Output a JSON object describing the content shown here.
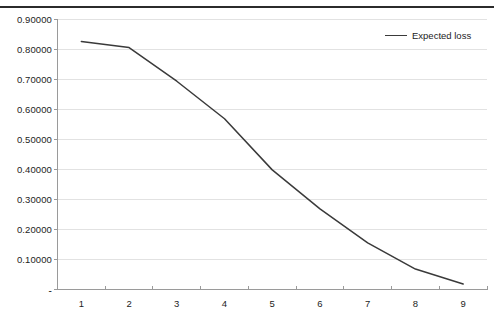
{
  "chart_data": {
    "type": "line",
    "title": "",
    "subtitle": "",
    "xlabel": "",
    "ylabel": "",
    "x": [
      1,
      2,
      3,
      4,
      5,
      6,
      7,
      8,
      9
    ],
    "categories": [
      "1",
      "2",
      "3",
      "4",
      "5",
      "6",
      "7",
      "8",
      "9"
    ],
    "series": [
      {
        "name": "Expected loss",
        "color": "#3a3a3a",
        "values": [
          0.825,
          0.805,
          0.693,
          0.568,
          0.398,
          0.268,
          0.155,
          0.068,
          0.018
        ]
      }
    ],
    "xlim": [
      0.5,
      9.5
    ],
    "ylim": [
      0.0,
      0.9
    ],
    "ytick_values": [
      0.9,
      0.8,
      0.7,
      0.6,
      0.5,
      0.4,
      0.3,
      0.2,
      0.1,
      0.0
    ],
    "ytick_labels": [
      "0.90000",
      "0.80000",
      "0.70000",
      "0.60000",
      "0.50000",
      "0.40000",
      "0.30000",
      "0.20000",
      "0.10000",
      "-"
    ],
    "xtick_labels": [
      "1",
      "2",
      "3",
      "4",
      "5",
      "6",
      "7",
      "8",
      "9"
    ],
    "grid": {
      "horizontal": true,
      "vertical": false,
      "color": "#e2e2e2"
    },
    "legend": {
      "position": "top-right",
      "entries": [
        {
          "label": "Expected loss",
          "color": "#3a3a3a"
        }
      ]
    },
    "axis_color": "#9a9a9a",
    "plot_background": "#ffffff"
  },
  "decor": {
    "top_rule_color": "#2b2b2b"
  }
}
